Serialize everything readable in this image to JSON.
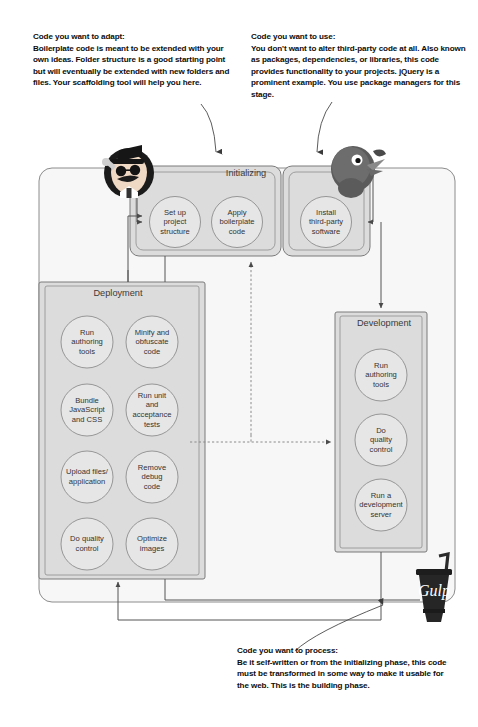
{
  "annotations": {
    "adapt": {
      "title": "Code you want to adapt:",
      "body": "Boilerplate code is meant to be extended with your own ideas. Folder structure is a good starting point but will eventually be extended with new folders and files. Your scaffolding tool will help you here."
    },
    "use": {
      "title": "Code you want to use:",
      "body": "You don't want to alter third-party code at all. Also known as packages, dependencies, or libraries, this code provides functionality to your projects. jQuery is a prominent example. You use package managers for this stage."
    },
    "process": {
      "title": "Code you want to process:",
      "body": "Be it self-written or from the initializing phase, this code must be transformed in some way to make it usable for the web. This is the building phase."
    }
  },
  "diagram": {
    "type": "flow",
    "sections": [
      {
        "id": "initializing",
        "title": "Initializing",
        "nodes": [
          {
            "id": "set-up-project-structure",
            "lines": [
              "Set up",
              "project",
              "structure"
            ]
          },
          {
            "id": "apply-boilerplate-code",
            "lines": [
              "Apply",
              "boilerplate",
              "code"
            ]
          },
          {
            "id": "install-third-party-software",
            "lines": [
              "Install",
              "third-party",
              "software"
            ]
          }
        ]
      },
      {
        "id": "deployment",
        "title": "Deployment",
        "nodes": [
          {
            "id": "run-authoring-tools",
            "lines": [
              "Run",
              "authoring",
              "tools"
            ]
          },
          {
            "id": "minify-and-obfuscate-code",
            "lines": [
              "Minify and",
              "obfuscate",
              "code"
            ]
          },
          {
            "id": "bundle-javascript-and-css",
            "lines": [
              "Bundle",
              "JavaScript",
              "and CSS"
            ]
          },
          {
            "id": "run-unit-and-acceptance-tests",
            "lines": [
              "Run unit",
              "and",
              "acceptance",
              "tests"
            ]
          },
          {
            "id": "upload-files-application",
            "lines": [
              "Upload files/",
              "application"
            ]
          },
          {
            "id": "remove-debug-code",
            "lines": [
              "Remove",
              "debug",
              "code"
            ]
          },
          {
            "id": "do-quality-control",
            "lines": [
              "Do quality",
              "control"
            ]
          },
          {
            "id": "optimize-images",
            "lines": [
              "Optimize",
              "images"
            ]
          }
        ]
      },
      {
        "id": "development",
        "title": "Development",
        "nodes": [
          {
            "id": "run-authoring-tools-dev",
            "lines": [
              "Run",
              "authoring",
              "tools"
            ]
          },
          {
            "id": "do-quality-control-dev",
            "lines": [
              "Do",
              "quality",
              "control"
            ]
          },
          {
            "id": "run-a-development-server",
            "lines": [
              "Run a",
              "development",
              "server"
            ]
          }
        ]
      }
    ],
    "logos": [
      {
        "id": "yeoman-mascot",
        "name": "yeoman-mascot-icon"
      },
      {
        "id": "bower-mascot",
        "name": "bower-mascot-icon"
      },
      {
        "id": "gulp-logo",
        "name": "gulp-cup-logo",
        "wordmark": "Gulp"
      }
    ],
    "colors": {
      "section_fill": "#dcdcdc",
      "node_fill": "#e3e3e3",
      "outline": "#6f6f6f",
      "canvas_fill": "#f7f7f7",
      "text": "#333333"
    }
  }
}
